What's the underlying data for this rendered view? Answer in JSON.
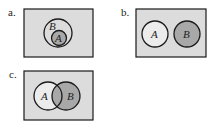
{
  "colors": {
    "background": "#ffffff",
    "universe_fill": "#dcdcdc",
    "set_fill": "#ececec",
    "shaded_fill": "#a8a8a8",
    "stroke": "#1a1a1a"
  },
  "panels": [
    {
      "label": "a.",
      "description": "A is a subset of B; A shaded",
      "sets": [
        {
          "name": "B",
          "shaded": false
        },
        {
          "name": "A",
          "shaded": true
        }
      ]
    },
    {
      "label": "b.",
      "description": "A and B disjoint; B shaded",
      "sets": [
        {
          "name": "A",
          "shaded": false
        },
        {
          "name": "B",
          "shaded": true
        }
      ]
    },
    {
      "label": "c.",
      "description": "A and B overlapping; B shaded",
      "sets": [
        {
          "name": "A",
          "shaded": false
        },
        {
          "name": "B",
          "shaded": true
        }
      ]
    }
  ]
}
